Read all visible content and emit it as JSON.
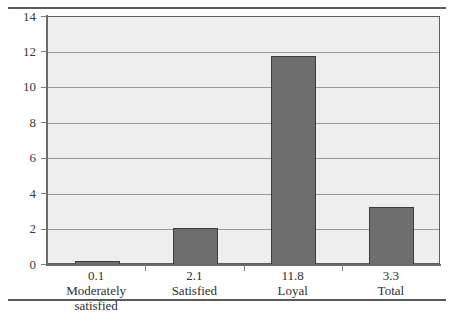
{
  "chart_data": {
    "type": "bar",
    "title": "",
    "subtitle": "",
    "xlabel": "",
    "ylabel": "",
    "categories": [
      "Moderately\nsatisfied",
      "Satisfied",
      "Loyal",
      "Total"
    ],
    "category_labels": [
      "Moderately satisfied",
      "Satisfied",
      "Loyal",
      "Total"
    ],
    "values": [
      0.1,
      2.1,
      11.8,
      3.3
    ],
    "data_labels": [
      "0.1",
      "2.1",
      "11.8",
      "3.3"
    ],
    "ylim": [
      0,
      14
    ],
    "ytick_values": [
      0,
      2,
      4,
      6,
      8,
      10,
      12,
      14
    ],
    "ytick_labels": [
      "0",
      "2",
      "4",
      "6",
      "8",
      "10",
      "12",
      "14"
    ],
    "grid": true,
    "grid_axis": "y",
    "legend": false,
    "legend_position": "none",
    "bar_color": "#6e6e6e",
    "bar_edge_color": "#3c3c3c",
    "plot_background": "#eeeeee",
    "gridline_color": "#9a9a9a",
    "axis_color": "#6a6a6a",
    "page_background": "#ffffff"
  },
  "figure": {
    "top_rule": "",
    "bottom_rule": ""
  }
}
